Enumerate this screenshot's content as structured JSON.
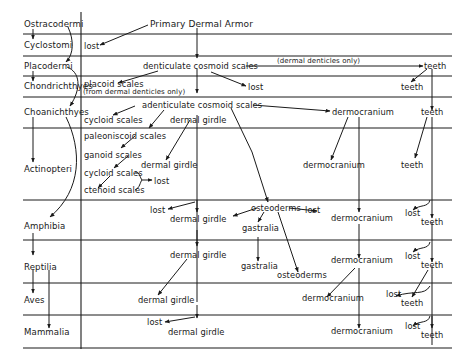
{
  "title": "Primary Dermal Armor",
  "taxa": [
    "Ostracodermi",
    "Cyclostomi",
    "Placodermi",
    "Chondrichthyes",
    "Choanichthyes",
    "Actinopteri",
    "Amphibia",
    "Reptilia",
    "Aves",
    "Mammalia"
  ],
  "labels": {
    "cyclostomi_lost": "lost",
    "placo_scales": "denticulate cosmoid scales",
    "placo_note": "(dermal denticles only)",
    "placo_teeth": "teeth",
    "chond_placoid": "placoid scales",
    "chond_placoid_note": "(from dermal denticles only)",
    "chond_lost": "lost",
    "chond_teeth": "teeth",
    "choan_scales": "adenticulate cosmoid scales",
    "choan_cycloid": "cycloid scales",
    "choan_girdle": "dermal girdle",
    "choan_dermo": "dermocranium",
    "choan_teeth": "teeth",
    "act_paleo": "paleoniscoid scales",
    "act_ganoid": "ganoid scales",
    "act_cycloid": "cycloid scales",
    "act_ctenoid": "ctenoid scales",
    "act_lost": "lost",
    "act_girdle": "dermal girdle",
    "act_dermo": "dermocranium",
    "act_teeth": "teeth",
    "amph_lost1": "lost",
    "amph_girdle": "dermal girdle",
    "amph_osteo": "osteoderms",
    "amph_lost2": "lost",
    "amph_gastralia": "gastralia",
    "amph_dermo": "dermocranium",
    "amph_lost3": "lost",
    "amph_teeth": "teeth",
    "rept_girdle": "dermal girdle",
    "rept_gastralia": "gastralia",
    "rept_osteo": "osteoderms",
    "rept_dermo": "dermocranium",
    "rept_lost": "lost",
    "rept_teeth": "teeth",
    "aves_girdle": "dermal girdle",
    "aves_dermo": "dermocranium",
    "aves_lost": "lost",
    "aves_teeth": "teeth",
    "mamm_lost": "lost",
    "mamm_girdle": "dermal girdle",
    "mamm_dermo": "dermocranium",
    "mamm_lost2": "lost",
    "mamm_teeth": "teeth"
  },
  "colors": {
    "ink": "#1a1a1a",
    "background": "#ffffff"
  }
}
